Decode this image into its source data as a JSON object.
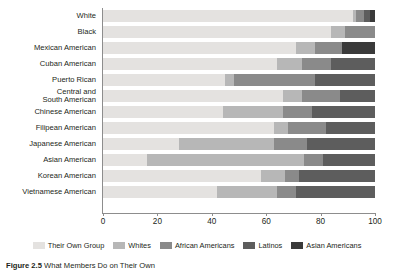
{
  "chart_data": {
    "type": "bar",
    "orientation": "horizontal",
    "stacked": true,
    "title": "",
    "xlabel": "",
    "ylabel": "",
    "xlim": [
      0,
      100
    ],
    "xticks": [
      0,
      20,
      40,
      60,
      80,
      100
    ],
    "xtick_labels": [
      "0",
      "20",
      "40",
      "60",
      "80",
      "100"
    ],
    "grid": false,
    "legend_position": "bottom",
    "categories": [
      "White",
      "Black",
      "Mexican American",
      "Cuban American",
      "Puerto Rican",
      "Central and\nSouth American",
      "Chinese American",
      "Filipean American",
      "Japanese American",
      "Asian American",
      "Korean American",
      "Vietnamese American"
    ],
    "series": [
      {
        "name": "Their Own Group",
        "color": "#e4e2e0",
        "values": [
          92,
          84,
          71,
          64,
          45,
          66,
          44,
          63,
          28,
          16,
          58,
          42
        ]
      },
      {
        "name": "Whites",
        "color": "#b7b7b7",
        "values": [
          1,
          5,
          7,
          9,
          3,
          7,
          22,
          5,
          35,
          58,
          9,
          22
        ]
      },
      {
        "name": "African Americans",
        "color": "#8a8a8a",
        "values": [
          3,
          11,
          10,
          11,
          30,
          14,
          11,
          14,
          12,
          7,
          5,
          7
        ]
      },
      {
        "name": "Latinos",
        "color": "#5d5d5d",
        "values": [
          2,
          0,
          0,
          16,
          22,
          13,
          23,
          18,
          25,
          19,
          28,
          29
        ]
      },
      {
        "name": "Asian Americans",
        "color": "#3a3a3a",
        "values": [
          2,
          0,
          12,
          0,
          0,
          0,
          0,
          0,
          0,
          0,
          0,
          0
        ]
      }
    ]
  },
  "caption": {
    "number": "Figure 2.5",
    "text": "What Members Do on Their Own"
  },
  "colors": {
    "axis": "#8d8d8d",
    "text": "#231f20",
    "background": "#ffffff"
  }
}
